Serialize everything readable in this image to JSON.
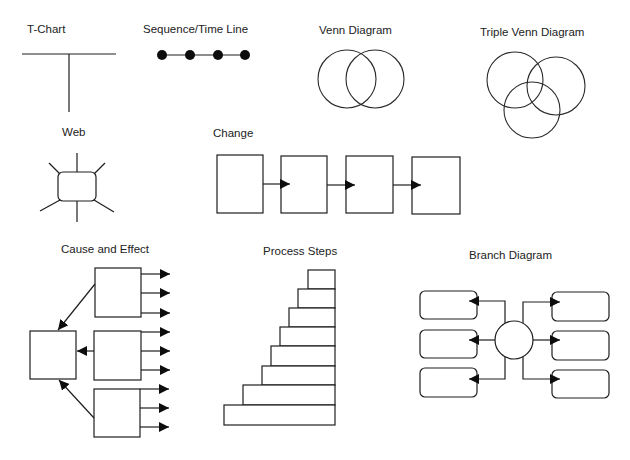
{
  "page": {
    "background": "#ffffff",
    "ink_color": "#1e1e1e"
  },
  "organizers": [
    {
      "id": "t-chart",
      "label": "T-Chart"
    },
    {
      "id": "sequence",
      "label": "Sequence/Time Line",
      "dots": 4
    },
    {
      "id": "venn",
      "label": "Venn Diagram",
      "circles": 2
    },
    {
      "id": "triple-venn",
      "label": "Triple Venn Diagram",
      "circles": 3
    },
    {
      "id": "web",
      "label": "Web",
      "spokes": 6
    },
    {
      "id": "change",
      "label": "Change",
      "boxes": 4,
      "arrows": 3
    },
    {
      "id": "cause-effect",
      "label": "Cause and Effect",
      "cause_boxes": 3,
      "effect_box": 1,
      "outgoing_arrows": 9
    },
    {
      "id": "process-steps",
      "label": "Process Steps",
      "steps": 8
    },
    {
      "id": "branch",
      "label": "Branch Diagram",
      "hub": "circle",
      "branches": 6
    }
  ]
}
